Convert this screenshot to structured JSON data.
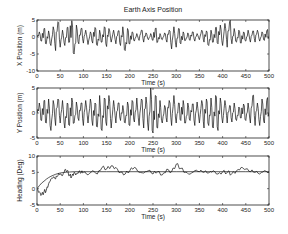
{
  "figure": {
    "title": "Earth Axis Position"
  },
  "chart_data": [
    {
      "type": "line",
      "title": "Earth Axis Position",
      "xlabel": "Time (s)",
      "ylabel": "X Position (m)",
      "xlim": [
        0,
        500
      ],
      "ylim": [
        -10,
        5
      ],
      "xticks": [
        0,
        50,
        100,
        150,
        200,
        250,
        300,
        350,
        400,
        450,
        500
      ],
      "yticks": [
        -10,
        -5,
        0,
        5
      ],
      "grid": false,
      "series": [
        {
          "name": "X position",
          "x": [
            0,
            5,
            10,
            15,
            20,
            25,
            30,
            35,
            40,
            45,
            50,
            55,
            60,
            65,
            70,
            75,
            80,
            85,
            90,
            95,
            100,
            105,
            110,
            115,
            120,
            125,
            130,
            135,
            140,
            145,
            150,
            155,
            160,
            165,
            170,
            175,
            180,
            185,
            190,
            195,
            200,
            205,
            210,
            215,
            220,
            225,
            230,
            235,
            240,
            245,
            250,
            255,
            260,
            265,
            270,
            275,
            280,
            285,
            290,
            295,
            300,
            305,
            310,
            315,
            320,
            325,
            330,
            335,
            340,
            345,
            350,
            355,
            360,
            365,
            370,
            375,
            380,
            385,
            390,
            395,
            400,
            405,
            410,
            415,
            420,
            425,
            430,
            435,
            440,
            445,
            450,
            455,
            460,
            465,
            470,
            475,
            480,
            485,
            490,
            495,
            500
          ],
          "values": [
            0,
            1.5,
            -1.2,
            2.5,
            -2,
            1.8,
            -2.5,
            3,
            -4,
            4.5,
            -3,
            2,
            -2.5,
            2.8,
            -1.5,
            4.8,
            -5,
            3.5,
            -2,
            2.5,
            -1.8,
            2,
            -2.2,
            1.5,
            -1.8,
            2.8,
            -2.5,
            2,
            -1.5,
            3,
            -2.8,
            2.5,
            -1.5,
            2,
            -2,
            1.8,
            -2.5,
            3,
            -4,
            2.5,
            -2,
            1.5,
            -1.2,
            1,
            -1,
            2,
            -1.5,
            1.2,
            -0.8,
            1,
            -1,
            2.5,
            -1.5,
            1,
            -0.8,
            1.2,
            -1.5,
            2,
            -3.5,
            3,
            -3,
            2.5,
            -2,
            1.5,
            -1,
            1.2,
            -1,
            1.5,
            -1.2,
            1,
            -0.8,
            2,
            -1.5,
            1.8,
            -2.5,
            2,
            -1.5,
            2.8,
            -2,
            3.5,
            -2.5,
            4,
            -3,
            4.5,
            -2,
            2.5,
            -1.5,
            2,
            -1.8,
            1.5,
            -1.2,
            2,
            -1.5,
            1.8,
            -1.5,
            2,
            -1.2,
            1.5,
            -1,
            1.8,
            0
          ]
        }
      ]
    },
    {
      "type": "line",
      "xlabel": "Time (s)",
      "ylabel": "Y Position (m)",
      "xlim": [
        0,
        500
      ],
      "ylim": [
        -5,
        5
      ],
      "xticks": [
        0,
        50,
        100,
        150,
        200,
        250,
        300,
        350,
        400,
        450,
        500
      ],
      "yticks": [
        -5,
        0,
        5
      ],
      "grid": false,
      "series": [
        {
          "name": "Y position",
          "x": [
            0,
            5,
            10,
            15,
            20,
            25,
            30,
            35,
            40,
            45,
            50,
            55,
            60,
            65,
            70,
            75,
            80,
            85,
            90,
            95,
            100,
            105,
            110,
            115,
            120,
            125,
            130,
            135,
            140,
            145,
            150,
            155,
            160,
            165,
            170,
            175,
            180,
            185,
            190,
            195,
            200,
            205,
            210,
            215,
            220,
            225,
            230,
            235,
            240,
            245,
            250,
            255,
            260,
            265,
            270,
            275,
            280,
            285,
            290,
            295,
            300,
            305,
            310,
            315,
            320,
            325,
            330,
            335,
            340,
            345,
            350,
            355,
            360,
            365,
            370,
            375,
            380,
            385,
            390,
            395,
            400,
            405,
            410,
            415,
            420,
            425,
            430,
            435,
            440,
            445,
            450,
            455,
            460,
            465,
            470,
            475,
            480,
            485,
            490,
            495,
            500
          ],
          "values": [
            0,
            2,
            -1.5,
            2.5,
            -2,
            2.8,
            -3.5,
            2.5,
            -2.5,
            2.8,
            -2,
            2.5,
            -3,
            2,
            -2.5,
            3,
            -2,
            2.2,
            -1.5,
            2,
            -2.5,
            2.5,
            -2,
            2.8,
            -2.5,
            2,
            -2.8,
            3.5,
            -3.5,
            3,
            -2.5,
            3.5,
            -3,
            2.5,
            -2,
            2,
            -1.5,
            1.5,
            -2,
            2.2,
            -2.5,
            2.5,
            -1.8,
            3,
            -2.5,
            2.8,
            -3,
            3.2,
            -3.5,
            5,
            -4,
            3.5,
            -3,
            2.5,
            -2,
            1.5,
            -1.8,
            2.5,
            -2.5,
            3.5,
            -2,
            2,
            -1.5,
            2.5,
            -2,
            2,
            -1.5,
            1.8,
            -2.5,
            2.2,
            -2,
            2.5,
            -3,
            2.8,
            -2.5,
            3,
            -3,
            3.5,
            -3.5,
            3,
            -2,
            2.5,
            -2,
            1.5,
            -1.8,
            2,
            -1.5,
            1.2,
            -1,
            1.8,
            -1.5,
            2,
            -2,
            3.5,
            -2.5,
            2,
            -2.5,
            2.8,
            -2,
            2.5,
            0
          ]
        }
      ]
    },
    {
      "type": "line",
      "xlabel": "Time (s)",
      "ylabel": "Heading (Deg)",
      "xlim": [
        0,
        500
      ],
      "ylim": [
        -5,
        10
      ],
      "xticks": [
        0,
        50,
        100,
        150,
        200,
        250,
        300,
        350,
        400,
        450,
        500
      ],
      "yticks": [
        -5,
        0,
        5,
        10
      ],
      "grid": false,
      "series": [
        {
          "name": "Heading measured",
          "x": [
            0,
            5,
            10,
            15,
            20,
            25,
            30,
            35,
            40,
            45,
            50,
            55,
            60,
            65,
            70,
            75,
            80,
            85,
            90,
            95,
            100,
            110,
            120,
            130,
            140,
            150,
            160,
            170,
            180,
            190,
            200,
            210,
            220,
            230,
            240,
            250,
            260,
            270,
            280,
            290,
            300,
            310,
            320,
            330,
            340,
            350,
            360,
            370,
            380,
            390,
            400,
            410,
            420,
            430,
            440,
            450,
            460,
            470,
            480,
            490,
            500
          ],
          "values": [
            0,
            -1,
            -1.8,
            -1,
            -0.5,
            1.5,
            3,
            3.5,
            3,
            4,
            4.5,
            4,
            5.8,
            5.5,
            4,
            3.8,
            5,
            4.5,
            5.2,
            4.8,
            5,
            4.2,
            5.5,
            4.5,
            6.5,
            6,
            7,
            6.5,
            5,
            4.5,
            5.5,
            6.5,
            5,
            4.8,
            5.5,
            4.5,
            5.2,
            4.2,
            6,
            5.2,
            7.5,
            6.2,
            5,
            4.5,
            5.5,
            5.2,
            5,
            4.8,
            5.5,
            4.5,
            5.2,
            5,
            4.6,
            5.5,
            6.5,
            6,
            5.2,
            5,
            4.5,
            5.5,
            5
          ]
        },
        {
          "name": "Heading estimate",
          "x": [
            0,
            5,
            10,
            15,
            20,
            25,
            30,
            35,
            40,
            45,
            50,
            60,
            70,
            80,
            100,
            150,
            200,
            250,
            300,
            350,
            400,
            450,
            500
          ],
          "values": [
            0,
            0.9,
            1.7,
            2.3,
            2.9,
            3.4,
            3.8,
            4.1,
            4.4,
            4.6,
            4.8,
            5,
            5.1,
            5.2,
            5.2,
            5.2,
            5.2,
            5.2,
            5.2,
            5.2,
            5.2,
            5.2,
            5.2
          ]
        }
      ]
    }
  ],
  "subplots": [
    {
      "ylabel": "X Position (m)",
      "xlabel": "Time (s)",
      "yticks": [
        "5",
        "0",
        "-5",
        "-10"
      ]
    },
    {
      "ylabel": "Y Position (m)",
      "xlabel": "Time (s)",
      "yticks": [
        "5",
        "0",
        "-5"
      ]
    },
    {
      "ylabel": "Heading (Deg)",
      "xlabel": "Time (s)",
      "yticks": [
        "10",
        "5",
        "0",
        "-5"
      ]
    }
  ],
  "xtick_labels": [
    "0",
    "50",
    "100",
    "150",
    "200",
    "250",
    "300",
    "350",
    "400",
    "450",
    "500"
  ]
}
